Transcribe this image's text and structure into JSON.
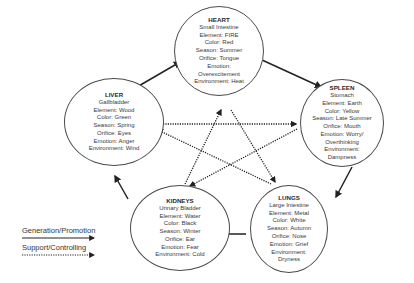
{
  "nodes": {
    "heart": {
      "title": "HEART",
      "lines": [
        "Small Intestine",
        "Element: FIRE",
        "Color: Red",
        "Season: Summer",
        "Orifice: Tongue",
        "Emotion:",
        "Overexcitement",
        "Environment: Heat"
      ]
    },
    "spleen": {
      "title": "SPLEEN",
      "lines": [
        "Stomach",
        "Element: Earth",
        "Color: Yellow",
        "Season: Late Summer",
        "Orifice: Mouth",
        "Emotion: Worry/",
        "Overthinking",
        "Environment:",
        "Dampness"
      ]
    },
    "liver": {
      "title": "LIVER",
      "lines": [
        "Gallbladder",
        "Element: Wood",
        "Color: Green",
        "Season: Spring",
        "Orifice: Eyes",
        "Emotion: Anger",
        "Environment: Wind"
      ]
    },
    "kidneys": {
      "title": "KIDNEYS",
      "lines": [
        "Urinary Bladder",
        "Element: Water",
        "Color: Black",
        "Season: Winter",
        "Orifice: Ear",
        "Emotion: Fear",
        "Environment: Cold"
      ]
    },
    "lungs": {
      "title": "LUNGS",
      "lines": [
        "Large Intestine",
        "Element: Metal",
        "Color: White",
        "Season: Autumn",
        "Orifice: Nose",
        "Emotion: Grief",
        "Environment:",
        "Dryness"
      ]
    }
  },
  "legend": {
    "generation_label": "Generation/Promotion",
    "support_label": "Support/Controlling"
  },
  "colors": {
    "line": "#222222",
    "border": "#4a4a4a",
    "text": "#333333"
  },
  "generation_cycle": [
    "liver",
    "heart",
    "spleen",
    "lungs",
    "kidneys",
    "liver"
  ],
  "controlling_cycle": [
    [
      "liver",
      "spleen"
    ],
    [
      "spleen",
      "kidneys"
    ],
    [
      "kidneys",
      "heart"
    ],
    [
      "heart",
      "lungs"
    ],
    [
      "lungs",
      "liver"
    ]
  ]
}
